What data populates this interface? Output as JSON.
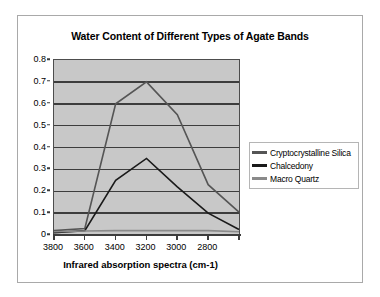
{
  "chart_data": {
    "type": "line",
    "title": "Water Content of Different Types of Agate Bands",
    "xlabel": "Infrared absorption spectra (cm-1)",
    "ylabel": "",
    "categories": [
      "3800",
      "3600",
      "3400",
      "3200",
      "3000",
      "2800",
      ""
    ],
    "x_tick_labels": [
      "3800",
      "3600",
      "3400",
      "3200",
      "3000",
      "2800"
    ],
    "y_tick_labels": [
      "0",
      "0.1",
      "0.2",
      "0.3",
      "0.4",
      "0.5",
      "0.6",
      "0.7",
      "0.8"
    ],
    "ylim": [
      0,
      0.8
    ],
    "y_step": 0.1,
    "grid": "horizontal",
    "legend_position": "right",
    "series": [
      {
        "name": "Cryptocrystalline Silica",
        "color": "#555555",
        "values": [
          0.02,
          0.03,
          0.6,
          0.7,
          0.55,
          0.23,
          0.105
        ]
      },
      {
        "name": "Chalcedony",
        "color": "#1a1a1a",
        "values": [
          0.01,
          0.02,
          0.25,
          0.35,
          0.22,
          0.1,
          0.025
        ]
      },
      {
        "name": "Macro Quartz",
        "color": "#8a8a8a",
        "values": [
          0.015,
          0.018,
          0.02,
          0.02,
          0.02,
          0.02,
          0.015
        ]
      }
    ],
    "plot_background": "#c8c8c8",
    "gridline_color": "#3d3d3d",
    "axis_color": "#3d3d3d",
    "frame_color": "#a9a9a9"
  }
}
